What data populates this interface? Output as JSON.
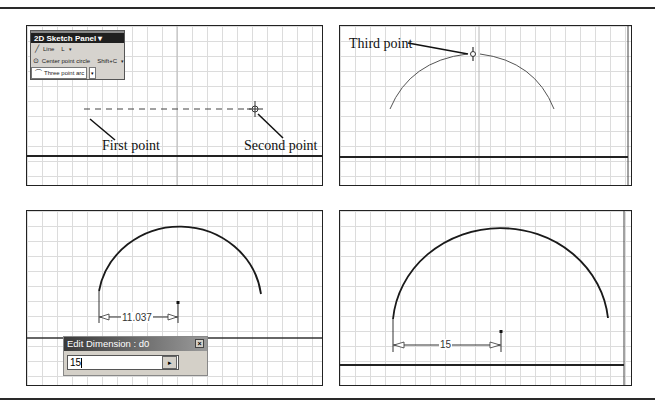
{
  "figure": {
    "panels": [
      {
        "id": "step-1",
        "palette": {
          "title": "2D Sketch Panel ▾",
          "items": [
            {
              "icon": "line-icon",
              "glyph": "╱",
              "label": "Line",
              "shortcut": "L",
              "dropdown": "▾"
            },
            {
              "icon": "circle-icon",
              "glyph": "⊙",
              "label": "Center point circle",
              "shortcut": "Shift+C",
              "dropdown": "▾"
            },
            {
              "icon": "arc-icon",
              "glyph": "⌒",
              "label": "Three point arc",
              "shortcut": "",
              "dropdown": "▾"
            }
          ]
        },
        "callouts": {
          "first": "First point",
          "second": "Second point"
        }
      },
      {
        "id": "step-2",
        "callouts": {
          "third": "Third point"
        }
      },
      {
        "id": "step-3",
        "dimension_value": "11.037",
        "dialog": {
          "title": "Edit Dimension : d0",
          "close_glyph": "×",
          "input_value": "15",
          "accept_glyph": "▸"
        }
      },
      {
        "id": "step-4",
        "dimension_value": "15"
      }
    ],
    "colors": {
      "border": "#222222",
      "grid": "#dcdcdc",
      "geometry": "#1a1a1a",
      "palette_bg": "#d6d3ce",
      "palette_title": "#1f1f1f",
      "dialog_bg": "#d4d0c8"
    }
  }
}
